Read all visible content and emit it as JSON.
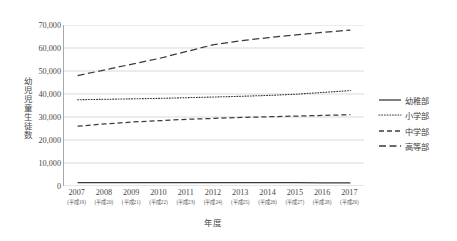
{
  "chart_data": {
    "type": "line",
    "title": "",
    "xlabel": "年度",
    "ylabel": "幼児児童生徒数",
    "ylim": [
      0,
      70000
    ],
    "ytick_step": 10000,
    "grid": true,
    "legend_position": "right",
    "categories": [
      "2007",
      "2008",
      "2009",
      "2010",
      "2011",
      "2012",
      "2013",
      "2014",
      "2015",
      "2016",
      "2017"
    ],
    "category_sublabels": [
      "(平成19)",
      "(平成20)",
      "(平成21)",
      "(平成22)",
      "(平成23)",
      "(平成24)",
      "(平成25)",
      "(平成26)",
      "(平成27)",
      "(平成28)",
      "(平成29)"
    ],
    "ytick_labels": [
      "70,000",
      "60,000",
      "50,000",
      "40,000",
      "30,000",
      "20,000",
      "10,000",
      "0"
    ],
    "ytick_values": [
      70000,
      60000,
      50000,
      40000,
      30000,
      20000,
      10000,
      0
    ],
    "series": [
      {
        "name": "幼稚部",
        "style": "solid",
        "values": [
          1500,
          1500,
          1500,
          1500,
          1500,
          1450,
          1450,
          1450,
          1450,
          1400,
          1400
        ]
      },
      {
        "name": "小学部",
        "style": "dotted",
        "values": [
          37500,
          37700,
          37900,
          38100,
          38400,
          38700,
          39000,
          39400,
          39900,
          40700,
          41500
        ]
      },
      {
        "name": "中学部",
        "style": "dashed",
        "values": [
          26000,
          27000,
          27800,
          28400,
          29000,
          29400,
          29800,
          30100,
          30400,
          30700,
          31000
        ]
      },
      {
        "name": "高等部",
        "style": "longdash",
        "values": [
          48000,
          50500,
          53000,
          55500,
          58500,
          61500,
          63200,
          64500,
          65700,
          66800,
          67800
        ]
      }
    ]
  },
  "legend": {
    "items": [
      {
        "label": "幼稚部",
        "style": "solid"
      },
      {
        "label": "小学部",
        "style": "dotted"
      },
      {
        "label": "中学部",
        "style": "dashed"
      },
      {
        "label": "高等部",
        "style": "longdash"
      }
    ]
  },
  "colors": {
    "line": "#3a3a3a",
    "grid": "#c9c9c9",
    "axis": "#a9a9a9",
    "text": "#4a4a4a",
    "background": "#ffffff"
  }
}
